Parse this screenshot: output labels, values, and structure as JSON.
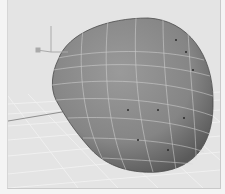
{
  "viewport": {
    "name": "3D perspective viewport",
    "background": "#e4e4e4",
    "grid_color": "#f2f2f2",
    "mesh_color": "#8a8a8a",
    "mesh_shadow": "#5e5e5e",
    "wire_color": "#d8d8d8",
    "control_vertex_color": "#2a2a2a"
  },
  "object": {
    "type": "deformed sphere mesh",
    "display": "shaded with wireframe"
  },
  "manipulator": {
    "type": "move-axis gizmo"
  }
}
